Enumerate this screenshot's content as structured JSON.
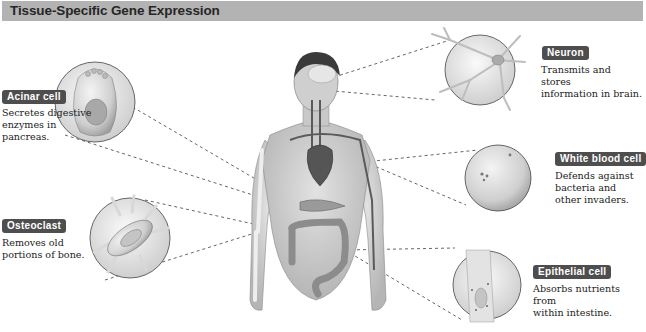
{
  "header": {
    "title": "Tissue-Specific Gene Expression"
  },
  "colors": {
    "header_bg": "#b3b3b3",
    "badge_bg": "#4e4e4e",
    "badge_text": "#ffffff"
  },
  "callouts": [
    {
      "id": "acinar",
      "label": "Acinar cell",
      "description": "Secretes digestive\nenzymes in\npancreas.",
      "organ": "pancreas"
    },
    {
      "id": "osteoclast",
      "label": "Osteoclast",
      "description": "Removes old\nportions of bone.",
      "organ": "bone"
    },
    {
      "id": "neuron",
      "label": "Neuron",
      "description": "Transmits and stores\ninformation in brain.",
      "organ": "brain"
    },
    {
      "id": "wbc",
      "label": "White blood cell",
      "description": "Defends against\nbacteria and\nother invaders.",
      "organ": "blood vessels"
    },
    {
      "id": "epithelial",
      "label": "Epithelial cell",
      "description": "Absorbs nutrients from\nwithin intestine.",
      "organ": "intestine"
    }
  ]
}
